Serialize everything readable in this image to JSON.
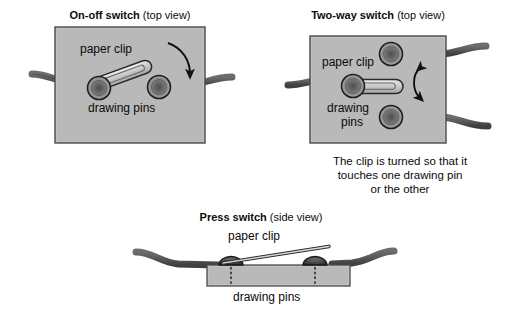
{
  "diagram": {
    "title_semantic": "switch-construction-diagram",
    "panels": [
      {
        "id": "on-off",
        "heading_bold": "On-off switch",
        "heading_regular": " (top view)",
        "labels": {
          "clip": "paper clip",
          "pins": "drawing pins"
        }
      },
      {
        "id": "two-way",
        "heading_bold": "Two-way switch",
        "heading_regular": " (top view)",
        "labels": {
          "clip": "paper clip",
          "pins_line1": "drawing",
          "pins_line2": "pins"
        },
        "note_lines": [
          "The clip is turned so that it",
          "touches one drawing pin",
          "or the other"
        ]
      },
      {
        "id": "press",
        "heading_bold": "Press switch",
        "heading_regular": " (side view)",
        "labels": {
          "clip": "paper clip",
          "pins": "drawing pins"
        }
      }
    ]
  },
  "colors": {
    "board_fill": "#b9b9b9",
    "board_border": "#4a4a4a",
    "wire": "#5d5d5d",
    "wire_edge": "#3a3a3a",
    "pin_rim": "#9a9a9a",
    "pin_core": "#5a5a5a",
    "pin_outline": "#1e1e1e",
    "clip_fill": "#cfcfcf",
    "clip_outline": "#2a2a2a",
    "arrow": "#111111",
    "text": "#0a0a0a",
    "page_bg": "#ffffff"
  }
}
